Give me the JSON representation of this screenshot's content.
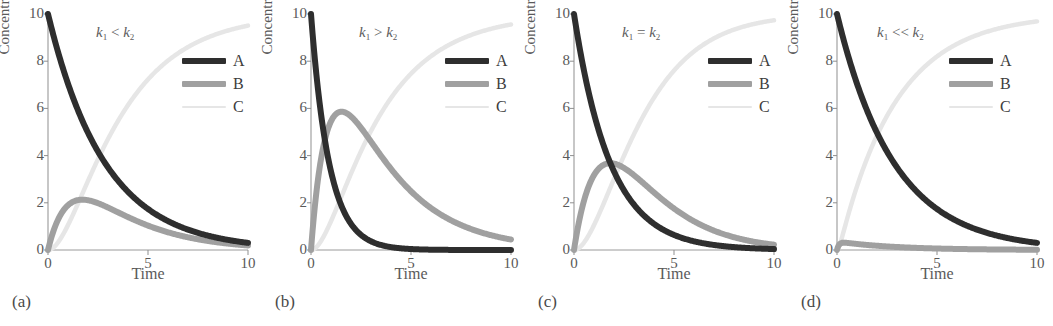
{
  "figure": {
    "panels": [
      {
        "panel_label": "(a)",
        "annotation_op": "<",
        "annotation_text": "k1 < k2",
        "xlabel": "Time",
        "ylabel": "Concentration"
      },
      {
        "panel_label": "(b)",
        "annotation_op": ">",
        "annotation_text": "k1 > k2",
        "xlabel": "Time",
        "ylabel": "Concentration"
      },
      {
        "panel_label": "(c)",
        "annotation_op": "=",
        "annotation_text": "k1 = k2",
        "xlabel": "Time",
        "ylabel": "Concentration"
      },
      {
        "panel_label": "(d)",
        "annotation_op": "<<",
        "annotation_text": "k1 << k2",
        "xlabel": "Time",
        "ylabel": "Concentration"
      }
    ],
    "legend": {
      "entries": [
        {
          "label": "A",
          "color": "#2e2e2e",
          "style": "thick"
        },
        {
          "label": "B",
          "color": "#a0a0a0",
          "style": "thick"
        },
        {
          "label": "C",
          "color": "#e6e6e6",
          "style": "thin"
        }
      ]
    },
    "axis_symbol": {
      "k": "k",
      "sub1": "1",
      "sub2": "2"
    }
  },
  "chart_data": [
    {
      "type": "line",
      "title": "k1 < k2",
      "panel_label": "(a)",
      "xlabel": "Time",
      "ylabel": "Concentration",
      "xlim": [
        0,
        10
      ],
      "ylim": [
        0,
        10
      ],
      "xticks": [
        0,
        5,
        10
      ],
      "yticks": [
        0,
        2,
        4,
        6,
        8,
        10
      ],
      "grid": false,
      "legend_position": "top-right",
      "model": "consecutive first-order A -> B -> C",
      "k1": 0.35,
      "k2": 0.9,
      "A0": 10,
      "series": [
        {
          "name": "A",
          "color": "#2e2e2e",
          "x": [
            0,
            0.5,
            1,
            1.5,
            2,
            2.5,
            3,
            4,
            5,
            6,
            7,
            8,
            9,
            10
          ],
          "values": [
            10.0,
            8.4,
            7.05,
            5.92,
            4.97,
            4.17,
            3.5,
            2.47,
            1.74,
            1.22,
            0.86,
            0.61,
            0.43,
            0.3
          ]
        },
        {
          "name": "B",
          "color": "#a0a0a0",
          "x": [
            0,
            0.5,
            1,
            1.5,
            2,
            2.5,
            3,
            4,
            5,
            6,
            7,
            8,
            9,
            10
          ],
          "values": [
            0.0,
            1.77,
            2.35,
            2.5,
            2.45,
            2.31,
            2.13,
            1.73,
            1.35,
            1.03,
            0.77,
            0.57,
            0.41,
            0.3
          ]
        },
        {
          "name": "C",
          "color": "#e6e6e6",
          "x": [
            0,
            0.5,
            1,
            1.5,
            2,
            2.5,
            3,
            4,
            5,
            6,
            7,
            8,
            9,
            10
          ],
          "values": [
            0.0,
            0.16,
            0.6,
            1.58,
            2.58,
            3.52,
            4.37,
            5.8,
            6.91,
            7.75,
            8.37,
            8.82,
            9.16,
            9.4
          ]
        }
      ]
    },
    {
      "type": "line",
      "title": "k1 > k2",
      "panel_label": "(b)",
      "xlabel": "Time",
      "ylabel": "Concentration",
      "xlim": [
        0,
        10
      ],
      "ylim": [
        0,
        10
      ],
      "xticks": [
        0,
        5,
        10
      ],
      "yticks": [
        0,
        2,
        4,
        6,
        8,
        10
      ],
      "grid": false,
      "legend_position": "top-right",
      "model": "consecutive first-order A -> B -> C",
      "k1": 1.1,
      "k2": 0.35,
      "A0": 10,
      "series": [
        {
          "name": "A",
          "color": "#2e2e2e",
          "x": [
            0,
            0.5,
            1,
            1.5,
            2,
            2.5,
            3,
            4,
            5,
            6,
            7,
            8,
            9,
            10
          ],
          "values": [
            10.0,
            5.77,
            3.33,
            1.92,
            1.11,
            0.64,
            0.37,
            0.12,
            0.04,
            0.01,
            0.0,
            0.0,
            0.0,
            0.0
          ]
        },
        {
          "name": "B",
          "color": "#a0a0a0",
          "x": [
            0,
            0.5,
            1,
            1.5,
            2,
            2.5,
            3,
            4,
            5,
            6,
            7,
            8,
            9,
            10
          ],
          "values": [
            0.0,
            3.55,
            4.69,
            4.93,
            4.77,
            4.46,
            4.1,
            3.38,
            2.76,
            2.24,
            1.8,
            1.45,
            1.16,
            0.93
          ]
        },
        {
          "name": "C",
          "color": "#e6e6e6",
          "x": [
            0,
            0.5,
            1,
            1.5,
            2,
            2.5,
            3,
            4,
            5,
            6,
            7,
            8,
            9,
            10
          ],
          "values": [
            0.0,
            0.68,
            1.98,
            3.15,
            4.12,
            4.9,
            5.53,
            6.5,
            7.2,
            7.75,
            8.2,
            8.55,
            8.84,
            9.07
          ]
        }
      ]
    },
    {
      "type": "line",
      "title": "k1 = k2",
      "panel_label": "(c)",
      "xlabel": "Time",
      "ylabel": "Concentration",
      "xlim": [
        0,
        10
      ],
      "ylim": [
        0,
        10
      ],
      "xticks": [
        0,
        5,
        10
      ],
      "yticks": [
        0,
        2,
        4,
        6,
        8,
        10
      ],
      "grid": false,
      "legend_position": "top-right",
      "model": "consecutive first-order A -> B -> C (equal rates)",
      "k1": 0.55,
      "k2": 0.55,
      "A0": 10,
      "series": [
        {
          "name": "A",
          "color": "#2e2e2e",
          "x": [
            0,
            0.5,
            1,
            1.5,
            2,
            2.5,
            3,
            4,
            5,
            6,
            7,
            8,
            9,
            10
          ],
          "values": [
            10.0,
            7.6,
            5.77,
            4.38,
            3.33,
            2.53,
            1.92,
            1.11,
            0.64,
            0.37,
            0.21,
            0.12,
            0.07,
            0.04
          ]
        },
        {
          "name": "B",
          "color": "#a0a0a0",
          "x": [
            0,
            0.5,
            1,
            1.5,
            2,
            2.5,
            3,
            4,
            5,
            6,
            7,
            8,
            9,
            10
          ],
          "values": [
            0.0,
            2.09,
            3.17,
            3.62,
            3.67,
            3.48,
            3.17,
            2.44,
            1.76,
            1.22,
            0.81,
            0.53,
            0.34,
            0.21
          ]
        },
        {
          "name": "C",
          "color": "#e6e6e6",
          "x": [
            0,
            0.5,
            1,
            1.5,
            2,
            2.5,
            3,
            4,
            5,
            6,
            7,
            8,
            9,
            10
          ],
          "values": [
            0.0,
            0.31,
            1.06,
            2.0,
            3.0,
            3.99,
            4.91,
            6.45,
            7.6,
            8.41,
            8.98,
            9.35,
            9.59,
            9.75
          ]
        }
      ]
    },
    {
      "type": "line",
      "title": "k1 << k2",
      "panel_label": "(d)",
      "xlabel": "Time",
      "ylabel": "Concentration",
      "xlim": [
        0,
        10
      ],
      "ylim": [
        0,
        10
      ],
      "xticks": [
        0,
        5,
        10
      ],
      "yticks": [
        0,
        2,
        4,
        6,
        8,
        10
      ],
      "grid": false,
      "legend_position": "top-right",
      "model": "consecutive first-order A -> B -> C (steady-state B)",
      "k1": 0.35,
      "k2": 10.0,
      "A0": 10,
      "series": [
        {
          "name": "A",
          "color": "#2e2e2e",
          "x": [
            0,
            0.5,
            1,
            1.5,
            2,
            2.5,
            3,
            4,
            5,
            6,
            7,
            8,
            9,
            10
          ],
          "values": [
            10.0,
            8.4,
            7.05,
            5.92,
            4.97,
            4.17,
            3.5,
            2.47,
            1.74,
            1.22,
            0.86,
            0.61,
            0.43,
            0.3
          ]
        },
        {
          "name": "B",
          "color": "#a0a0a0",
          "x": [
            0,
            0.5,
            1,
            1.5,
            2,
            2.5,
            3,
            4,
            5,
            6,
            7,
            8,
            9,
            10
          ],
          "values": [
            0.0,
            0.29,
            0.25,
            0.21,
            0.17,
            0.15,
            0.12,
            0.09,
            0.06,
            0.04,
            0.03,
            0.02,
            0.015,
            0.01
          ]
        },
        {
          "name": "C",
          "color": "#e6e6e6",
          "x": [
            0,
            0.5,
            1,
            1.5,
            2,
            2.5,
            3,
            4,
            5,
            6,
            7,
            8,
            9,
            10
          ],
          "values": [
            0.0,
            1.31,
            2.7,
            3.87,
            4.86,
            5.68,
            6.38,
            7.44,
            8.2,
            8.74,
            9.11,
            9.37,
            9.55,
            9.69
          ]
        }
      ]
    }
  ]
}
